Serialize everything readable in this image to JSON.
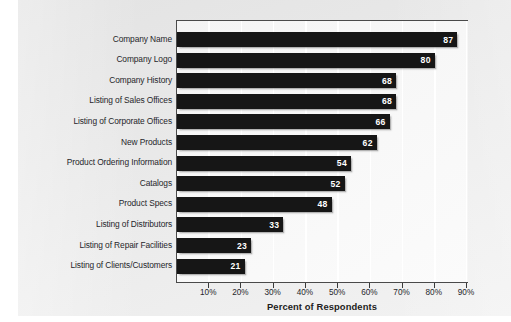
{
  "chart_data": {
    "type": "bar",
    "orientation": "horizontal",
    "title": "",
    "xlabel": "Percent of Respondents",
    "ylabel": "",
    "xlim": [
      0,
      90
    ],
    "xticks": [
      10,
      20,
      30,
      40,
      50,
      60,
      70,
      80,
      90
    ],
    "xtick_labels": [
      "10%",
      "20%",
      "30%",
      "40%",
      "50%",
      "60%",
      "70%",
      "80%",
      "90%"
    ],
    "grid": true,
    "grid_axis": "x",
    "legend": false,
    "bar_color": "#161616",
    "value_label_color": "#ffffff",
    "plot_background": "#f7f7f7",
    "page_background": "#e8e8e8",
    "categories": [
      "Company Name",
      "Company Logo",
      "Company History",
      "Listing of Sales Offices",
      "Listing of Corporate Offices",
      "New Products",
      "Product Ordering Information",
      "Catalogs",
      "Product Specs",
      "Listing of Distributors",
      "Listing of Repair Facilities",
      "Listing of Clients/Customers"
    ],
    "values": [
      87,
      80,
      68,
      68,
      66,
      62,
      54,
      52,
      48,
      33,
      23,
      21
    ],
    "value_labels": [
      "87",
      "80",
      "68",
      "68",
      "66",
      "62",
      "54",
      "52",
      "48",
      "33",
      "23",
      "21"
    ]
  }
}
